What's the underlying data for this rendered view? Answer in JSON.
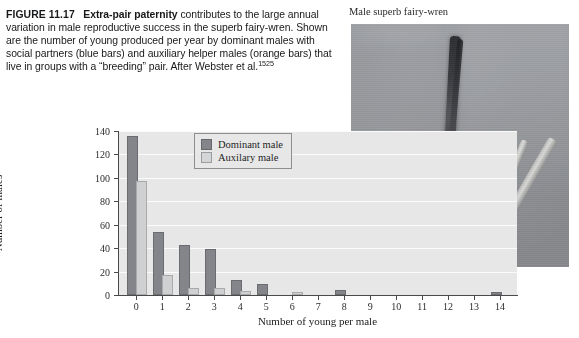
{
  "caption": {
    "figure_label": "FIGURE 11.17",
    "lead": "Extra-pair paternity",
    "body": " contributes to the large annual variation in male reproductive success in the superb fairy-wren. Shown are the number of young produced per year by dominant males with social partners (blue bars) and auxiliary helper males (orange bars) that live in groups with a “breeding” pair. After Webster et al.",
    "superscript": "1525"
  },
  "photo": {
    "title": "Male superb fairy-wren",
    "alt_name": "superb-fairy-wren-photograph"
  },
  "chart_data": {
    "type": "bar",
    "title": "",
    "xlabel": "Number of young per male",
    "ylabel": "Number of males",
    "categories": [
      "0",
      "1",
      "2",
      "3",
      "4",
      "5",
      "6",
      "7",
      "8",
      "9",
      "10",
      "11",
      "12",
      "13",
      "14"
    ],
    "series": [
      {
        "name": "Dominant male",
        "color": "#83858a",
        "values": [
          134,
          52,
          41,
          38,
          11,
          8,
          0,
          0,
          3,
          0,
          0,
          0,
          0,
          0,
          1
        ]
      },
      {
        "name": "Auxilary male",
        "color": "#cfd0d1",
        "values": [
          96,
          15,
          4,
          4,
          2,
          0,
          1,
          0,
          0,
          0,
          0,
          0,
          0,
          0,
          0
        ]
      }
    ],
    "ylim": [
      0,
      140
    ],
    "yticks": [
      0,
      20,
      40,
      60,
      80,
      100,
      120,
      140
    ],
    "grid": true,
    "legend_position": "top-center",
    "plot_background": "#e7e7e7"
  }
}
